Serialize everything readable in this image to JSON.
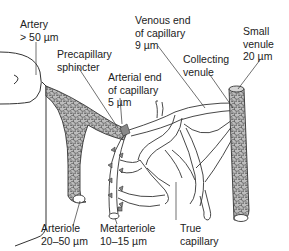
{
  "diagram": {
    "type": "anatomical-illustration",
    "colors": {
      "stroke": "#333333",
      "vessel_fill": "#b8b8b8",
      "cell_stroke": "#555555",
      "text": "#222222",
      "background": "#ffffff"
    },
    "labels": {
      "artery": {
        "name": "Artery",
        "size": "> 50 µm"
      },
      "precapillary_sphincter": {
        "line1": "Precapillary",
        "line2": "sphincter"
      },
      "arterial_end": {
        "line1": "Arterial end",
        "line2": "of capillary",
        "size": "5 µm"
      },
      "venous_end": {
        "line1": "Venous end",
        "line2": "of capillary",
        "size": "9 µm"
      },
      "collecting_venule": {
        "line1": "Collecting",
        "line2": "venule"
      },
      "small_venule": {
        "name": "Small",
        "line2": "venule",
        "size": "20 µm"
      },
      "arteriole": {
        "name": "Arteriole",
        "size": "20–50 µm"
      },
      "metarteriole": {
        "name": "Metarteriole",
        "size": "10–15 µm"
      },
      "true_capillary": {
        "line1": "True",
        "line2": "capillary"
      }
    }
  }
}
